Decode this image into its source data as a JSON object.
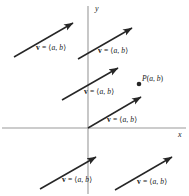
{
  "figure": {
    "type": "vector-diagram",
    "background_color": "#ffffff",
    "axis_color": "#9a9a9a",
    "vector_color": "#262626",
    "text_color": "#1a1a1a",
    "width": 189,
    "height": 196
  },
  "axes": {
    "x_label": "x",
    "y_label": "y",
    "origin": {
      "x": 88,
      "y": 128
    },
    "x_axis": {
      "x1": 2,
      "y1": 128,
      "x2": 186,
      "y2": 128
    },
    "y_axis": {
      "x1": 88,
      "y1": 6,
      "x2": 88,
      "y2": 194
    }
  },
  "vector_label": {
    "name": "v",
    "equals": " = ",
    "open": "⟨",
    "a": "a",
    "comma": ", ",
    "b": "b",
    "close": "⟩"
  },
  "point": {
    "name": "P",
    "open": "(",
    "a": "a",
    "comma": ", ",
    "b": "b",
    "close": ")",
    "x": 139,
    "y": 84
  },
  "vectors": [
    {
      "id": "vector-top-left",
      "x1": 14,
      "y1": 57,
      "x2": 73,
      "y2": 23,
      "label_x": 36,
      "label_y": 44
    },
    {
      "id": "vector-top-right",
      "x1": 78,
      "y1": 59,
      "x2": 132,
      "y2": 28,
      "label_x": 98,
      "label_y": 47
    },
    {
      "id": "vector-middle-left",
      "x1": 62,
      "y1": 100,
      "x2": 118,
      "y2": 68,
      "label_x": 84,
      "label_y": 88
    },
    {
      "id": "vector-origin",
      "x1": 88,
      "y1": 128,
      "x2": 141,
      "y2": 97,
      "label_x": 107,
      "label_y": 116
    },
    {
      "id": "vector-bottom-left",
      "x1": 40,
      "y1": 189,
      "x2": 96,
      "y2": 157,
      "label_x": 62,
      "label_y": 176
    },
    {
      "id": "vector-bottom-right",
      "x1": 115,
      "y1": 190,
      "x2": 172,
      "y2": 157,
      "label_x": 137,
      "label_y": 178
    }
  ]
}
